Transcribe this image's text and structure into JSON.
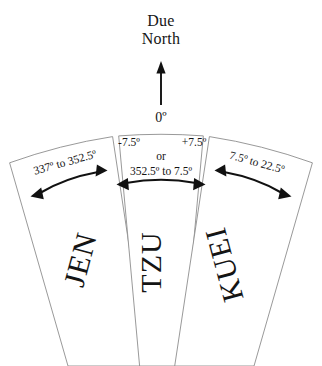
{
  "diagram": {
    "title_line1": "Due",
    "title_line2": "North",
    "north_arrow_label": "0º",
    "sectors": [
      {
        "id": "jen",
        "name": "JEN",
        "range_label": "337º to 352.5º",
        "start_deg": 337,
        "end_deg": 352.5,
        "position": "left"
      },
      {
        "id": "tzu",
        "name": "TZU",
        "range_label": "352.5º to 7.5º",
        "alt_min_label": "-7.5º",
        "alt_max_label": "+7.5º",
        "conjunction": "or",
        "start_deg": 352.5,
        "end_deg": 7.5,
        "position": "center"
      },
      {
        "id": "kuei",
        "name": "KUEI",
        "range_label": "7.5º to 22.5º",
        "start_deg": 7.5,
        "end_deg": 22.5,
        "position": "right"
      }
    ],
    "colors": {
      "background": "#ffffff",
      "outline": "#8d8d8d",
      "ink": "#141414",
      "arrow": "#111111"
    }
  }
}
